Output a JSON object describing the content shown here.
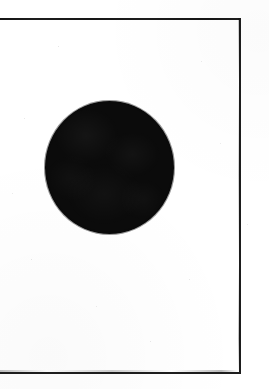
{
  "page": {
    "kind": "scanned-figure-page",
    "width": 269,
    "height": 389,
    "background_color": "#ffffff",
    "caption": "",
    "label": "",
    "visible_text": []
  },
  "frame": {
    "name": "figure-border",
    "stroke_color": "#1d1d1d",
    "stroke_width_px": 2,
    "top_y": 20,
    "right_x": 239,
    "bottom_y": 372,
    "left_edge": "cropped",
    "sides_visible": [
      "top",
      "right",
      "bottom"
    ]
  },
  "figure": {
    "shape": "circle",
    "fill_color": "#0b0b0b",
    "center_x": 109,
    "center_y": 167,
    "width_px": 129,
    "height_px": 133,
    "filled": true,
    "outline": "none"
  },
  "chart_data": {
    "type": "scatter",
    "title": "",
    "xlabel": "",
    "ylabel": "",
    "grid": false,
    "legend": "none",
    "xlim": [
      0,
      269
    ],
    "ylim": [
      0,
      389
    ],
    "marks": [
      {
        "shape": "circle",
        "cx": 109,
        "cy": 167,
        "rx": 64.5,
        "ry": 66.5,
        "fill": "#0b0b0b"
      }
    ],
    "annotations": []
  }
}
